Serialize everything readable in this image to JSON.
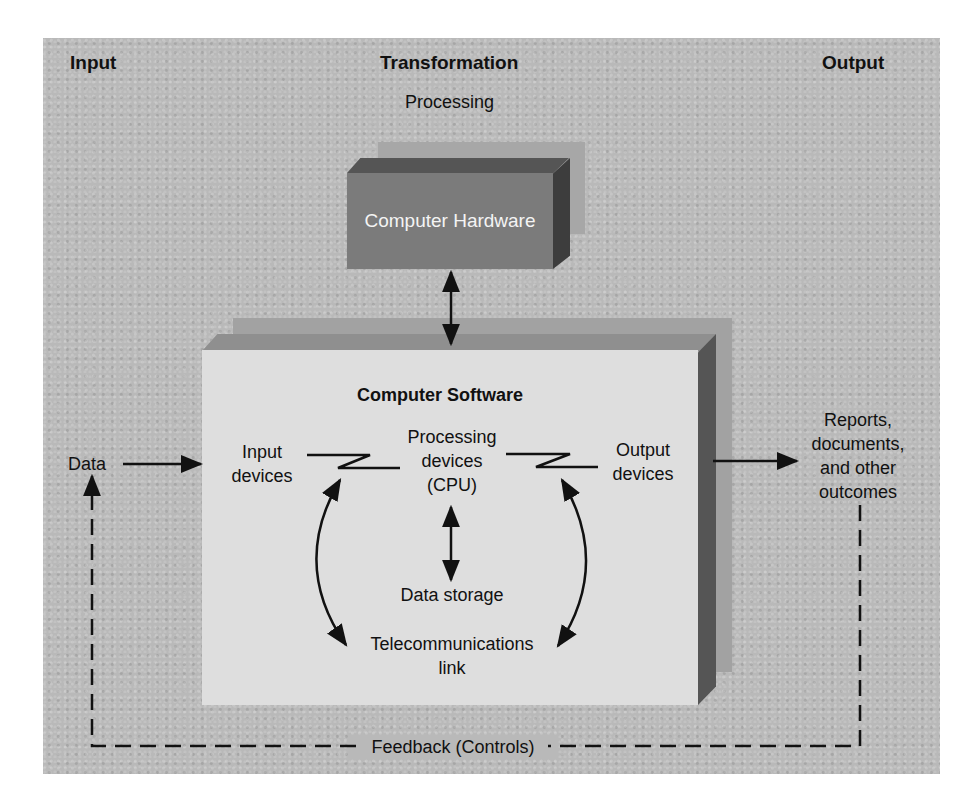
{
  "headers": {
    "input": "Input",
    "transformation": "Transformation",
    "output": "Output",
    "processing": "Processing"
  },
  "hardware": {
    "label": "Computer Hardware"
  },
  "software": {
    "title": "Computer Software",
    "input_devices": [
      "Input",
      "devices"
    ],
    "processing_devices": [
      "Processing",
      "devices",
      "(CPU)"
    ],
    "output_devices": [
      "Output",
      "devices"
    ],
    "data_storage": "Data storage",
    "telecom": [
      "Telecommunications",
      "link"
    ]
  },
  "data_label": "Data",
  "outcomes": [
    "Reports,",
    "documents,",
    "and other",
    "outcomes"
  ],
  "feedback_label": "Feedback (Controls)",
  "colors": {
    "background": "#b9b9b9",
    "hardware_face": "#7b7b7b",
    "software_face": "#dedede",
    "line": "#111111"
  }
}
